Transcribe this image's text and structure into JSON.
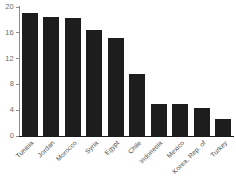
{
  "chart_data": {
    "type": "bar",
    "title": "",
    "subtitle": "",
    "xlabel": "",
    "ylabel": "",
    "categories": [
      "Tunisia",
      "Jordan",
      "Morocco",
      "Syria",
      "Egypt",
      "Chile",
      "Indonesia",
      "Mexico",
      "Korea, Rep. of",
      "Turkey"
    ],
    "values": [
      19.1,
      18.5,
      18.3,
      16.4,
      15.2,
      9.6,
      5.0,
      4.9,
      4.4,
      2.6
    ],
    "ylim": [
      0,
      20
    ],
    "yticks": [
      0,
      4,
      8,
      12,
      16,
      20
    ],
    "ytick_labels": [
      "0",
      "4",
      "8",
      "12",
      "16",
      "20"
    ],
    "grid": false,
    "legend": false,
    "legend_position": "none",
    "bar_color": "#1d1d1d",
    "axis_color": "#8d8d8d",
    "tick_label_color": "#6b6b6b",
    "category_label_color": "#4a4a4a",
    "background_color": "#ffffff",
    "xtick_label_rotation": -45
  }
}
